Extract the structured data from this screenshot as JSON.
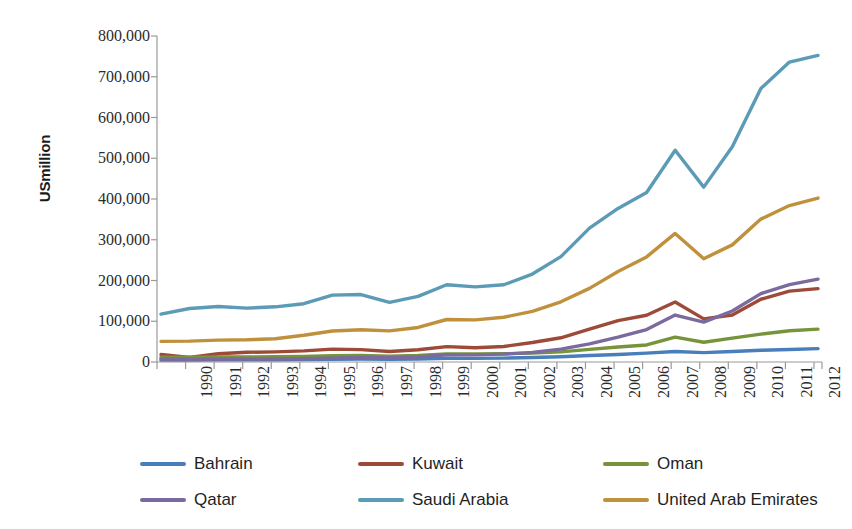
{
  "chart_data": {
    "type": "line",
    "title": "",
    "xlabel": "",
    "ylabel": "USmillion",
    "ylim": [
      0,
      800000
    ],
    "ytick_labels": [
      "800,000",
      "700,000",
      "600,000",
      "500,000",
      "400,000",
      "300,000",
      "200,000",
      "100,000",
      "0"
    ],
    "ytick_values": [
      800000,
      700000,
      600000,
      500000,
      400000,
      300000,
      200000,
      100000,
      0
    ],
    "grid": false,
    "legend_position": "bottom",
    "categories": [
      "1990",
      "1991",
      "1992",
      "1993",
      "1994",
      "1995",
      "1996",
      "1997",
      "1998",
      "1999",
      "2000",
      "2001",
      "2002",
      "2003",
      "2004",
      "2005",
      "2006",
      "2007",
      "2008",
      "2009",
      "2010",
      "2011",
      "2012",
      "2013"
    ],
    "series": [
      {
        "name": "Bahrain",
        "color": "#4A7EBB",
        "values": [
          4600,
          4900,
          5100,
          5300,
          5600,
          6100,
          6600,
          7200,
          6700,
          7400,
          9100,
          8900,
          9600,
          11100,
          13000,
          15970,
          18470,
          21730,
          25710,
          22940,
          25710,
          28780,
          30760,
          32890
        ]
      },
      {
        "name": "Kuwait",
        "color": "#9E4A38",
        "values": [
          18400,
          11100,
          20300,
          23800,
          24800,
          27200,
          31500,
          30400,
          25800,
          30100,
          37700,
          34900,
          38100,
          47900,
          59400,
          80800,
          101600,
          114700,
          147400,
          105900,
          115400,
          154000,
          174000,
          180000
        ]
      },
      {
        "name": "Oman",
        "color": "#77933C",
        "values": [
          11700,
          11600,
          12500,
          12400,
          12900,
          13800,
          15300,
          15800,
          14100,
          16000,
          19500,
          19900,
          20300,
          21700,
          24800,
          31100,
          36800,
          41900,
          60900,
          48400,
          58600,
          68400,
          76700,
          80600
        ]
      },
      {
        "name": "Qatar",
        "color": "#7B6A9E",
        "values": [
          7400,
          6900,
          7100,
          7000,
          7400,
          8100,
          9100,
          11300,
          10300,
          12400,
          17760,
          17540,
          19360,
          23530,
          31730,
          44530,
          60880,
          79710,
          115270,
          97800,
          125120,
          167780,
          189940,
          203230
        ]
      },
      {
        "name": "Saudi Arabia",
        "color": "#5B9BB5",
        "values": [
          117600,
          131300,
          136200,
          132300,
          135400,
          143000,
          164000,
          165600,
          146500,
          161000,
          189500,
          184300,
          189500,
          215800,
          258700,
          328500,
          376900,
          415900,
          519800,
          429100,
          528200,
          671200,
          735900,
          752500
        ]
      },
      {
        "name": "United Arab Emirates",
        "color": "#C0913C",
        "values": [
          50700,
          51300,
          53800,
          54500,
          57200,
          65700,
          76200,
          79300,
          76400,
          84700,
          104300,
          103300,
          109800,
          124300,
          147800,
          180600,
          222100,
          257900,
          315500,
          253500,
          287400,
          350700,
          384000,
          402300
        ]
      }
    ]
  },
  "legend": {
    "items": [
      {
        "label": "Bahrain",
        "color": "#4A7EBB"
      },
      {
        "label": "Kuwait",
        "color": "#9E4A38"
      },
      {
        "label": "Oman",
        "color": "#77933C"
      },
      {
        "label": "Qatar",
        "color": "#7B6A9E"
      },
      {
        "label": "Saudi Arabia",
        "color": "#5B9BB5"
      },
      {
        "label": "United Arab Emirates",
        "color": "#C0913C"
      }
    ]
  },
  "axis": {
    "line_color": "#9a9a9a",
    "tick_color": "#9a9a9a"
  }
}
